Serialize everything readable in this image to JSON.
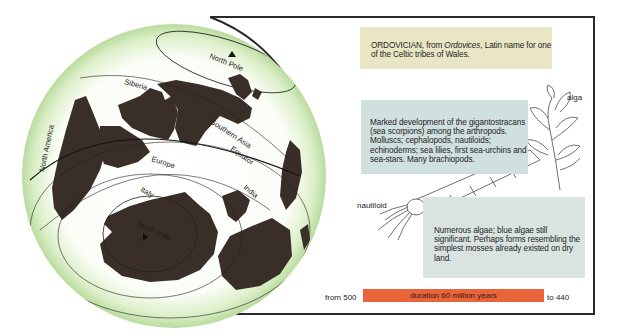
{
  "period": {
    "name": "ORDOVICIAN",
    "etymology_prefix": "ORDOVICIAN, from ",
    "etymology_term": "Ordovices",
    "etymology_suffix": ", Latin name for one of the Celtic tribes of Wales."
  },
  "fauna_text": "Marked development of the gigantostracans (sea scorpions) among the arthropods. Molluscs; cephalopods, nautiloids; echinoderms; sea lilies, first sea-urchins and sea-stars. Many brachiopods.",
  "flora_text": "Numerous algae; blue algae still significant. Perhaps forms resembling the simplest mosses already existed on dry land.",
  "illustrations": {
    "alga_label": "alga",
    "nautiloid_label": "nautiloid"
  },
  "map_labels": {
    "north_pole": "North Pole",
    "siberia": "Siberia",
    "southern_asia": "Southern Asia",
    "equator": "Equator",
    "north_america": "North America",
    "europe": "Europe",
    "italy": "Italy",
    "india": "India",
    "south_pole": "South Pole"
  },
  "timeline": {
    "from_label": "from 500",
    "duration_label": "duration 60 million years",
    "to_label": "to 440"
  },
  "colors": {
    "title_box": "#e9e6c6",
    "fauna_box": "#cfe0df",
    "flora_box": "#d9e4e1",
    "timebar": "#e8643a",
    "landmass": "#3a2f28",
    "globe_rim": "#cfe6b8"
  }
}
